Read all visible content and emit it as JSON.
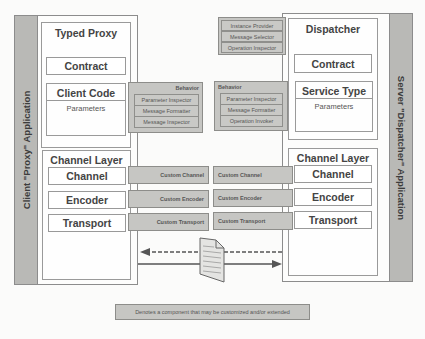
{
  "client": {
    "app_label": "Client \"Proxy\" Application",
    "typed_proxy": {
      "title": "Typed Proxy",
      "contract": "Contract",
      "client_code": "Client Code",
      "parameters": "Parameters"
    },
    "behavior": {
      "label": "Behavior",
      "items": [
        "Parameter Inspector",
        "Message Formatter",
        "Message Inspector"
      ]
    },
    "channel_layer": {
      "title": "Channel Layer",
      "items": [
        "Channel",
        "Encoder",
        "Transport"
      ]
    },
    "custom": [
      "Custom Channel",
      "Custom Encoder",
      "Custom Transport"
    ]
  },
  "server": {
    "app_label": "Server \"Dispatcher\" Application",
    "dispatcher_behaviors": [
      "Instance Provider",
      "Message Selector",
      "Operation Inspector"
    ],
    "dispatcher": {
      "title": "Dispatcher",
      "contract": "Contract",
      "service_type": "Service Type",
      "parameters": "Parameters"
    },
    "behavior": {
      "label": "Behavior",
      "items": [
        "Parameter Inspector",
        "Message Formatter",
        "Operation Invoker"
      ]
    },
    "channel_layer": {
      "title": "Channel Layer",
      "items": [
        "Channel",
        "Encoder",
        "Transport"
      ]
    },
    "custom": [
      "Custom Channel",
      "Custom Encoder",
      "Custom Transport"
    ]
  },
  "legend": {
    "text": "Denotes a component that may be customized and/or extended"
  },
  "colors": {
    "custom_fill": "#c6c6c3",
    "strip_fill": "#b9b9b6",
    "border": "#8c8c8c"
  }
}
